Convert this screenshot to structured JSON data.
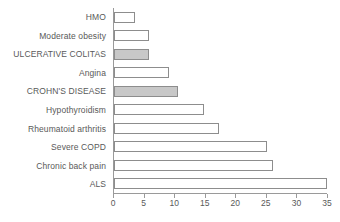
{
  "chart_data": {
    "type": "bar",
    "orientation": "horizontal",
    "title": "",
    "subtitle": "",
    "xlabel": "",
    "ylabel": "",
    "xlim": [
      0,
      35
    ],
    "xticks": [
      0,
      5,
      10,
      15,
      20,
      25,
      30,
      35
    ],
    "xtick_labels": [
      "0",
      "5",
      "10",
      "15",
      "20",
      "25",
      "30",
      "35"
    ],
    "grid": false,
    "legend": "none",
    "categories": [
      "HMO",
      "Moderate obesity",
      "ULCERATIVE COLITAS",
      "Angina",
      "CROHN'S DISEASE",
      "Hypothyroidism",
      "Rheumatoid arthritis",
      "Severe COPD",
      "Chronic back pain",
      "ALS"
    ],
    "values": [
      3.5,
      5.7,
      5.8,
      9.0,
      10.5,
      14.7,
      17.2,
      25.0,
      26.0,
      34.8
    ],
    "highlighted": [
      false,
      false,
      true,
      false,
      true,
      false,
      false,
      false,
      false,
      false
    ],
    "colors": {
      "bar_fill": "#ffffff",
      "bar_fill_highlight": "#c8c8c8",
      "bar_border": "#8d8d8d",
      "axis": "#9a9a9a",
      "text": "#595959",
      "background": "#ffffff"
    }
  }
}
